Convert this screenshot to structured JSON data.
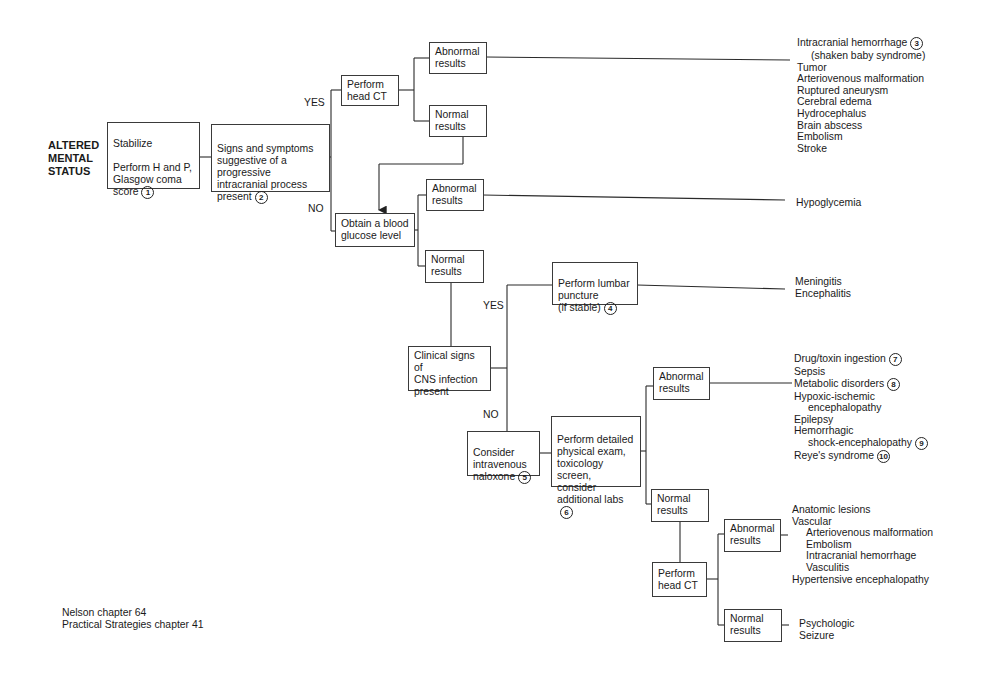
{
  "title": "ALTERED\nMENTAL\nSTATUS",
  "nodes": {
    "stabilize": {
      "line1": "Stabilize",
      "line2": "Perform H and P,\nGlasgow coma\nscore",
      "num": "1"
    },
    "signs": {
      "text": "Signs and symptoms\nsuggestive of a\nprogressive\nintracranial process\npresent",
      "num": "2"
    },
    "head_ct_1": {
      "text": "Perform\nhead CT"
    },
    "abnormal_1": {
      "text": "Abnormal\nresults"
    },
    "normal_1": {
      "text": "Normal\nresults"
    },
    "glucose": {
      "text": "Obtain a blood\nglucose level"
    },
    "abnormal_2": {
      "text": "Abnormal\nresults"
    },
    "normal_2": {
      "text": "Normal\nresults"
    },
    "cns": {
      "text": "Clinical signs of\nCNS infection\npresent"
    },
    "lumbar": {
      "text": "Perform lumbar\npuncture\n(if stable)",
      "num": "4"
    },
    "naloxone": {
      "text": "Consider\nintravenous\nnaloxone",
      "num": "5"
    },
    "detailed": {
      "text": "Perform detailed\nphysical exam,\ntoxicology screen,\nconsider\nadditional labs",
      "num": "6"
    },
    "abnormal_3": {
      "text": "Abnormal\nresults"
    },
    "normal_3": {
      "text": "Normal\nresults"
    },
    "head_ct_2": {
      "text": "Perform\nhead CT"
    },
    "abnormal_4": {
      "text": "Abnormal\nresults"
    },
    "normal_4": {
      "text": "Normal\nresults"
    }
  },
  "labels": {
    "yes_1": "YES",
    "no_1": "NO",
    "yes_2": "YES",
    "no_2": "NO"
  },
  "outcomes": {
    "head_ct_abnormal": {
      "items": [
        {
          "text": "Intracranial hemorrhage",
          "num": "3"
        },
        {
          "text": "(shaken baby syndrome)",
          "indent": true
        },
        {
          "text": "Tumor"
        },
        {
          "text": "Arteriovenous malformation"
        },
        {
          "text": "Ruptured aneurysm"
        },
        {
          "text": "Cerebral edema"
        },
        {
          "text": "Hydrocephalus"
        },
        {
          "text": "Brain abscess"
        },
        {
          "text": "Embolism"
        },
        {
          "text": "Stroke"
        }
      ]
    },
    "glucose_abnormal": {
      "items": [
        {
          "text": "Hypoglycemia"
        }
      ]
    },
    "lumbar": {
      "items": [
        {
          "text": "Meningitis"
        },
        {
          "text": "Encephalitis"
        }
      ]
    },
    "detailed_abnormal": {
      "items": [
        {
          "text": "Drug/toxin ingestion",
          "num": "7"
        },
        {
          "text": "Sepsis"
        },
        {
          "text": "Metabolic disorders",
          "num": "8"
        },
        {
          "text": "Hypoxic-ischemic"
        },
        {
          "text": "encephalopathy",
          "indent": true
        },
        {
          "text": "Epilepsy"
        },
        {
          "text": "Hemorrhagic"
        },
        {
          "text": "shock-encephalopathy",
          "indent": true,
          "num": "9"
        },
        {
          "text": "Reye's syndrome",
          "num": "10"
        }
      ]
    },
    "head_ct2_abnormal": {
      "items": [
        {
          "text": "Anatomic lesions"
        },
        {
          "text": "Vascular"
        },
        {
          "text": "Arteriovenous malformation",
          "indent": true
        },
        {
          "text": "Embolism",
          "indent": true
        },
        {
          "text": "Intracranial hemorrhage",
          "indent": true
        },
        {
          "text": "Vasculitis",
          "indent": true
        },
        {
          "text": "Hypertensive encephalopathy"
        }
      ]
    },
    "head_ct2_normal": {
      "items": [
        {
          "text": "Psychologic"
        },
        {
          "text": "Seizure"
        }
      ]
    }
  },
  "references": {
    "line1": "Nelson chapter 64",
    "line2": "Practical Strategies chapter 41"
  }
}
